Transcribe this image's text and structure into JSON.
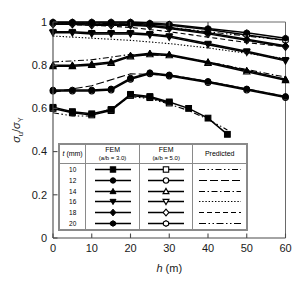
{
  "chart_data": {
    "type": "line",
    "title": "",
    "xlabel": "h (m)",
    "ylabel": "σu/σY",
    "xlim": [
      0,
      60
    ],
    "ylim": [
      0,
      1.0
    ],
    "xticks": [
      0,
      10,
      20,
      30,
      40,
      50,
      60
    ],
    "yticks": [
      0,
      0.2,
      0.4,
      0.6,
      0.8,
      1
    ],
    "ytick_labels": [
      "0",
      "0.2",
      "0.4",
      "0.6",
      "0.8",
      "1"
    ],
    "xtick_labels": [
      "0",
      "10",
      "20",
      "30",
      "40",
      "50",
      "60"
    ],
    "grid": false,
    "legend_position": "inside-bottom-center",
    "series": [
      {
        "name": "t = 20 mm, FEM (a/b = 3.0)",
        "t": 20,
        "group": "FEM (a/b = 3.0)",
        "marker": "hexagon",
        "fill": "filled",
        "linestyle": "solid",
        "x": [
          0,
          5,
          10,
          15,
          20,
          25,
          30,
          40,
          50,
          60
        ],
        "y": [
          1.0,
          1.0,
          1.0,
          1.0,
          1.0,
          0.995,
          0.99,
          0.97,
          0.95,
          0.925
        ]
      },
      {
        "name": "t = 20 mm, FEM (a/b = 5.0)",
        "t": 20,
        "group": "FEM (a/b = 5.0)",
        "marker": "hexagon",
        "fill": "open",
        "linestyle": "solid",
        "x": [
          0,
          5,
          10,
          15,
          20,
          25,
          30,
          40,
          50,
          60
        ],
        "y": [
          0.995,
          0.995,
          0.995,
          0.995,
          0.995,
          0.99,
          0.985,
          0.965,
          0.94,
          0.915
        ]
      },
      {
        "name": "t = 20 mm, Predicted",
        "t": 20,
        "group": "Predicted",
        "marker": "none",
        "linestyle": "dashdotdot",
        "x": [
          0,
          10,
          20,
          30,
          40,
          50,
          60
        ],
        "y": [
          0.995,
          0.995,
          0.99,
          0.975,
          0.955,
          0.935,
          0.915
        ]
      },
      {
        "name": "t = 18 mm, FEM (a/b = 3.0)",
        "t": 18,
        "group": "FEM (a/b = 3.0)",
        "marker": "diamond",
        "fill": "filled",
        "linestyle": "solid",
        "x": [
          0,
          5,
          10,
          15,
          20,
          25,
          30,
          40,
          50,
          60
        ],
        "y": [
          0.995,
          0.995,
          0.99,
          0.99,
          0.99,
          0.985,
          0.975,
          0.95,
          0.92,
          0.89
        ]
      },
      {
        "name": "t = 18 mm, FEM (a/b = 5.0)",
        "t": 18,
        "group": "FEM (a/b = 5.0)",
        "marker": "diamond",
        "fill": "open",
        "linestyle": "solid",
        "x": [
          0,
          5,
          10,
          15,
          20,
          25,
          30,
          40,
          50,
          60
        ],
        "y": [
          0.99,
          0.99,
          0.985,
          0.985,
          0.985,
          0.98,
          0.97,
          0.945,
          0.915,
          0.885
        ]
      },
      {
        "name": "t = 18 mm, Predicted",
        "t": 18,
        "group": "Predicted",
        "marker": "none",
        "linestyle": "dashed",
        "x": [
          0,
          10,
          20,
          30,
          40,
          50,
          60
        ],
        "y": [
          0.99,
          0.985,
          0.975,
          0.955,
          0.93,
          0.905,
          0.885
        ]
      },
      {
        "name": "t = 16 mm, FEM (a/b = 3.0)",
        "t": 16,
        "group": "FEM (a/b = 3.0)",
        "marker": "triangle-down",
        "fill": "filled",
        "linestyle": "solid",
        "x": [
          0,
          5,
          10,
          15,
          20,
          25,
          30,
          40,
          50,
          60
        ],
        "y": [
          0.955,
          0.955,
          0.95,
          0.95,
          0.95,
          0.945,
          0.935,
          0.9,
          0.865,
          0.825
        ]
      },
      {
        "name": "t = 16 mm, FEM (a/b = 5.0)",
        "t": 16,
        "group": "FEM (a/b = 5.0)",
        "marker": "triangle-down",
        "fill": "open",
        "linestyle": "solid",
        "x": [
          0,
          5,
          10,
          15,
          20,
          25,
          30,
          40,
          50,
          60
        ],
        "y": [
          0.95,
          0.95,
          0.945,
          0.945,
          0.945,
          0.94,
          0.93,
          0.895,
          0.86,
          0.82
        ]
      },
      {
        "name": "t = 16 mm, Predicted",
        "t": 16,
        "group": "Predicted",
        "marker": "none",
        "linestyle": "dotted",
        "x": [
          0,
          10,
          20,
          30,
          40,
          50,
          60
        ],
        "y": [
          0.935,
          0.925,
          0.915,
          0.9,
          0.88,
          0.855,
          0.83
        ]
      },
      {
        "name": "t = 14 mm, FEM (a/b = 3.0)",
        "t": 14,
        "group": "FEM (a/b = 3.0)",
        "marker": "triangle-up",
        "fill": "filled",
        "linestyle": "solid",
        "x": [
          0,
          5,
          10,
          15,
          20,
          25,
          30,
          40,
          50,
          60
        ],
        "y": [
          0.8,
          0.8,
          0.805,
          0.815,
          0.845,
          0.855,
          0.85,
          0.815,
          0.775,
          0.735
        ]
      },
      {
        "name": "t = 14 mm, FEM (a/b = 5.0)",
        "t": 14,
        "group": "FEM (a/b = 5.0)",
        "marker": "triangle-up",
        "fill": "open",
        "linestyle": "solid",
        "x": [
          0,
          5,
          10,
          15,
          20,
          25,
          30,
          40,
          50,
          60
        ],
        "y": [
          0.795,
          0.795,
          0.8,
          0.81,
          0.84,
          0.85,
          0.845,
          0.81,
          0.77,
          0.73
        ]
      },
      {
        "name": "t = 14 mm, Predicted",
        "t": 14,
        "group": "Predicted",
        "marker": "none",
        "linestyle": "dashdot",
        "x": [
          0,
          10,
          20,
          30,
          40,
          50,
          60
        ],
        "y": [
          0.815,
          0.825,
          0.85,
          0.845,
          0.815,
          0.78,
          0.745
        ]
      },
      {
        "name": "t = 12 mm, FEM (a/b = 3.0)",
        "t": 12,
        "group": "FEM (a/b = 3.0)",
        "marker": "circle",
        "fill": "filled",
        "linestyle": "solid",
        "x": [
          0,
          5,
          10,
          15,
          20,
          25,
          30,
          40,
          50,
          60
        ],
        "y": [
          0.685,
          0.685,
          0.685,
          0.69,
          0.74,
          0.765,
          0.755,
          0.725,
          0.69,
          0.655
        ]
      },
      {
        "name": "t = 12 mm, FEM (a/b = 5.0)",
        "t": 12,
        "group": "FEM (a/b = 5.0)",
        "marker": "circle",
        "fill": "open",
        "linestyle": "solid",
        "x": [
          0,
          5,
          10,
          15,
          20,
          25,
          30,
          40,
          50,
          60
        ],
        "y": [
          0.68,
          0.68,
          0.68,
          0.685,
          0.735,
          0.76,
          0.75,
          0.72,
          0.685,
          0.65
        ]
      },
      {
        "name": "t = 12 mm, Predicted",
        "t": 12,
        "group": "Predicted",
        "marker": "none",
        "linestyle": "longdash",
        "x": [
          0,
          10,
          20,
          30,
          40,
          50,
          60
        ],
        "y": [
          0.675,
          0.705,
          0.76,
          0.755,
          0.725,
          0.69,
          0.655
        ]
      },
      {
        "name": "t = 10 mm, FEM (a/b = 3.0)",
        "t": 10,
        "group": "FEM (a/b = 3.0)",
        "marker": "square",
        "fill": "filled",
        "linestyle": "solid",
        "x": [
          0,
          5,
          10,
          15,
          20,
          25,
          30,
          35,
          40,
          45
        ],
        "y": [
          0.605,
          0.585,
          0.575,
          0.595,
          0.665,
          0.655,
          0.63,
          0.6,
          0.555,
          0.48
        ]
      },
      {
        "name": "t = 10 mm, FEM (a/b = 5.0)",
        "t": 10,
        "group": "FEM (a/b = 5.0)",
        "marker": "square",
        "fill": "open",
        "linestyle": "solid",
        "x": [
          0,
          5,
          10,
          15,
          20,
          25,
          30
        ],
        "y": [
          0.6,
          0.58,
          0.57,
          0.59,
          0.66,
          0.65,
          0.625
        ]
      },
      {
        "name": "t = 10 mm, Predicted",
        "t": 10,
        "group": "Predicted",
        "marker": "none",
        "linestyle": "dashdotdot",
        "x": [
          0,
          5,
          10,
          15,
          20,
          25,
          30,
          35,
          40,
          45
        ],
        "y": [
          0.58,
          0.565,
          0.565,
          0.6,
          0.655,
          0.645,
          0.62,
          0.59,
          0.55,
          0.5
        ]
      }
    ]
  },
  "legend": {
    "headers": [
      {
        "main": "t",
        "unit": "(mm)",
        "sub": ""
      },
      {
        "main": "FEM",
        "unit": "",
        "sub": "(a/b = 3.0)"
      },
      {
        "main": "FEM",
        "unit": "",
        "sub": "(a/b = 5.0)"
      },
      {
        "main": "Predicted",
        "unit": "",
        "sub": ""
      }
    ],
    "rows": [
      {
        "t": "10",
        "marker": "square",
        "predicted_style": "dashdotdot"
      },
      {
        "t": "12",
        "marker": "circle",
        "predicted_style": "longdash"
      },
      {
        "t": "14",
        "marker": "triangle-up",
        "predicted_style": "dashdot"
      },
      {
        "t": "16",
        "marker": "triangle-down",
        "predicted_style": "dotted"
      },
      {
        "t": "18",
        "marker": "diamond",
        "predicted_style": "dashed"
      },
      {
        "t": "20",
        "marker": "hexagon",
        "predicted_style": "dashdotdot2"
      }
    ]
  },
  "colors": {
    "line": "#000000",
    "axis": "#4a4a4a",
    "background": "#ffffff",
    "legend_border": "#8a8a8a"
  }
}
